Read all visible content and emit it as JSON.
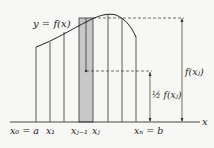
{
  "diagram": {
    "curve_label": "y = f(x)",
    "axis_label": "x",
    "tick_labels": [
      {
        "text": "x₀ = a",
        "x": 36
      },
      {
        "text": "x₁",
        "x": 50
      },
      {
        "text": "xⱼ₋₁",
        "x": 79
      },
      {
        "text": "xⱼ",
        "x": 93
      },
      {
        "text": "xₙ = b",
        "x": 136
      }
    ],
    "height_label": "f(xⱼ)",
    "half_height_label": "½ f(xⱼ)",
    "shaded_color": "#c8c8c8"
  }
}
